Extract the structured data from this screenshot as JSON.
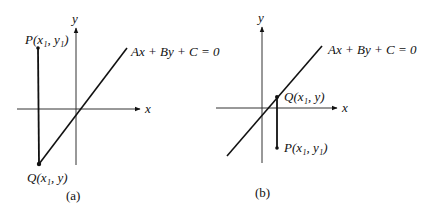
{
  "figure": {
    "panels": [
      {
        "id": "a",
        "caption": "(a)",
        "axis_x_label": "x",
        "axis_y_label": "y",
        "line_equation": "Ax + By + C = 0",
        "point_p_label": "P(x₁, y₁)",
        "point_q_label": "Q(x₁, y)"
      },
      {
        "id": "b",
        "caption": "(b)",
        "axis_x_label": "x",
        "axis_y_label": "y",
        "line_equation": "Ax + By + C = 0",
        "point_p_label": "P(x₁, y₁)",
        "point_q_label": "Q(x₁, y)"
      }
    ],
    "colors": {
      "ink": "#111111",
      "axis": "#333333",
      "background": "#ffffff"
    }
  }
}
